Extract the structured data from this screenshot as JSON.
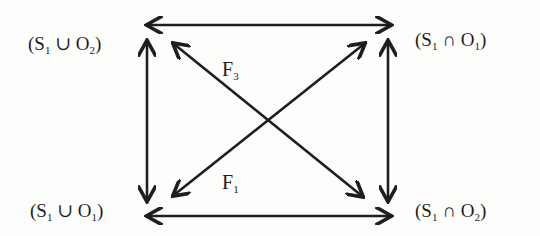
{
  "diagram": {
    "nodes": {
      "top_left": {
        "open": "(S",
        "s_sub": "1",
        "op": " ∪ ",
        "o": "O",
        "o_sub": "2",
        "close": ")"
      },
      "top_right": {
        "open": "(S",
        "s_sub": "1",
        "op": " ∩ ",
        "o": "O",
        "o_sub": "1",
        "close": ")"
      },
      "bottom_left": {
        "open": "(S",
        "s_sub": "1",
        "op": " ∪ ",
        "o": "O",
        "o_sub": "1",
        "close": ")"
      },
      "bottom_right": {
        "open": "(S",
        "s_sub": "1",
        "op": " ∩ ",
        "o": "O",
        "o_sub": "2",
        "close": ")"
      }
    },
    "labels": {
      "f3": {
        "main": "F",
        "sub": "3"
      },
      "f1": {
        "main": "F",
        "sub": "1"
      }
    },
    "edges": [
      {
        "from": "top_left",
        "to": "top_right",
        "type": "bidirectional"
      },
      {
        "from": "bottom_left",
        "to": "bottom_right",
        "type": "bidirectional"
      },
      {
        "from": "top_left",
        "to": "bottom_left",
        "type": "bidirectional"
      },
      {
        "from": "top_right",
        "to": "bottom_right",
        "type": "bidirectional"
      },
      {
        "from": "bottom_right",
        "to": "top_left",
        "type": "directed",
        "label": "F3"
      },
      {
        "from": "top_right",
        "to": "bottom_left",
        "type": "bidirectional",
        "label": "F1"
      }
    ],
    "stroke_color": "#1e1e1e"
  }
}
